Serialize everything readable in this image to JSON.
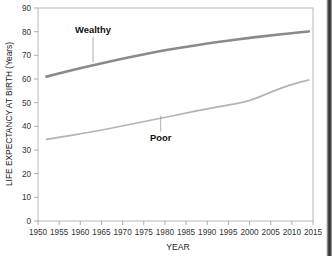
{
  "chart_data": {
    "type": "line",
    "title": "",
    "xlabel": "YEAR",
    "ylabel": "LIFE EXPECTANCY AT BIRTH (Years)",
    "xlim": [
      1950,
      2015
    ],
    "ylim": [
      0,
      90
    ],
    "xticks": [
      1950,
      1955,
      1960,
      1965,
      1970,
      1975,
      1980,
      1985,
      1990,
      1995,
      2000,
      2005,
      2010,
      2015
    ],
    "yticks": [
      0,
      10,
      20,
      30,
      40,
      50,
      60,
      70,
      80,
      90
    ],
    "grid": false,
    "legend_position": "inline-annotation",
    "series": [
      {
        "name": "Wealthy",
        "color": "#8a8a8a",
        "line_width": 2.6,
        "annotation": {
          "label": "Wealthy",
          "x": 1963,
          "y": 79.5,
          "leader_to_y": 67.0
        },
        "x": [
          1952,
          1955,
          1960,
          1965,
          1970,
          1975,
          1980,
          1985,
          1990,
          1995,
          2000,
          2005,
          2010,
          2014
        ],
        "y": [
          61.0,
          62.4,
          64.6,
          66.6,
          68.6,
          70.4,
          72.2,
          73.6,
          75.0,
          76.2,
          77.4,
          78.4,
          79.4,
          80.1
        ]
      },
      {
        "name": "Poor",
        "color": "#b3b3b3",
        "line_width": 1.7,
        "annotation": {
          "label": "Poor",
          "x": 1979,
          "y": 34.0,
          "leader_to_y": 44.5
        },
        "x": [
          1952,
          1955,
          1960,
          1965,
          1970,
          1975,
          1980,
          1985,
          1990,
          1995,
          2000,
          2005,
          2010,
          2014
        ],
        "y": [
          34.5,
          35.3,
          36.8,
          38.4,
          40.2,
          42.0,
          43.8,
          45.6,
          47.4,
          49.0,
          50.6,
          54.5,
          57.8,
          59.6
        ]
      }
    ]
  },
  "axes": {
    "x_axis_label": "YEAR",
    "y_axis_label": "LIFE EXPECTANCY AT BIRTH (Years)",
    "x_tick_labels": [
      "1950",
      "1955",
      "1960",
      "1965",
      "1970",
      "1975",
      "1980",
      "1985",
      "1990",
      "1995",
      "2000",
      "2005",
      "2010",
      "2015"
    ],
    "y_tick_labels": [
      "0",
      "10",
      "20",
      "30",
      "40",
      "50",
      "60",
      "70",
      "80",
      "90"
    ]
  },
  "annotations": {
    "wealthy": "Wealthy",
    "poor": "Poor"
  },
  "colors": {
    "wealthy_line": "#8a8a8a",
    "poor_line": "#b3b3b3",
    "axis": "#9a9a9a",
    "text": "#1a1a1a",
    "background": "#ffffff"
  }
}
